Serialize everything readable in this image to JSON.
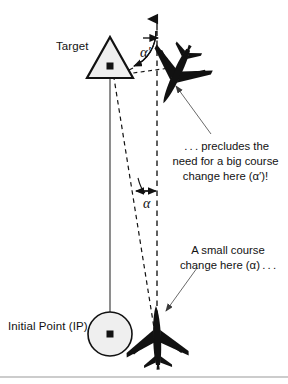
{
  "figure": {
    "width": 288,
    "height": 384,
    "background": "#ffffff",
    "ink_color": "#121212",
    "fill_color": "#efefef",
    "rule_color": "#9a9a9a"
  },
  "labels": {
    "target": "Target",
    "initial_point": "Initial Point (IP)"
  },
  "angles": {
    "alpha_prime": "α′",
    "alpha": "α"
  },
  "callouts": {
    "top": " . . . precludes the need for a big course change here (α′)!",
    "bottom": "A small course change here (α) . . ."
  },
  "symbols": {
    "target_marker": "triangle-with-center-dot",
    "ip_marker": "circle-with-center-dot",
    "aircraft_upper": "aircraft-silhouette-banked",
    "aircraft_lower": "aircraft-silhouette-upright"
  },
  "lines": {
    "track_solid": "solid-line-ip-to-target",
    "track_dashed_offset": "dashed-line-offset-course",
    "track_dashed_vertical": "dashed-line-original-heading-with-arrow",
    "leader_top": "leader-line-to-upper-aircraft",
    "leader_bottom": "leader-line-to-lower-aircraft"
  }
}
